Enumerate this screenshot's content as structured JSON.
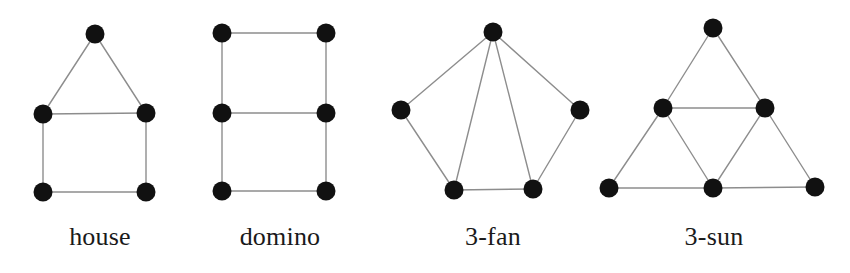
{
  "figure": {
    "type": "graph-diagram",
    "background_color": "#ffffff",
    "node_color": "#111111",
    "edge_color": "#8d8d8d",
    "label_color": "#1a1a1a",
    "node_radius": 9.5,
    "edge_width": 1.4,
    "width": 850,
    "height": 273
  },
  "graphs": [
    {
      "id": "house",
      "label": "house",
      "node_count": 5,
      "edge_count": 6,
      "nodes": [
        {
          "id": "a",
          "x": 95,
          "y": 34
        },
        {
          "id": "b",
          "x": 43,
          "y": 114
        },
        {
          "id": "c",
          "x": 146,
          "y": 113
        },
        {
          "id": "d",
          "x": 43,
          "y": 192
        },
        {
          "id": "e",
          "x": 146,
          "y": 192
        }
      ],
      "edges": [
        [
          "a",
          "b"
        ],
        [
          "a",
          "c"
        ],
        [
          "b",
          "c"
        ],
        [
          "b",
          "d"
        ],
        [
          "c",
          "e"
        ],
        [
          "d",
          "e"
        ]
      ]
    },
    {
      "id": "domino",
      "label": "domino",
      "node_count": 6,
      "edge_count": 7,
      "nodes": [
        {
          "id": "a",
          "x": 222,
          "y": 33
        },
        {
          "id": "b",
          "x": 326,
          "y": 33
        },
        {
          "id": "c",
          "x": 222,
          "y": 113
        },
        {
          "id": "d",
          "x": 326,
          "y": 113
        },
        {
          "id": "e",
          "x": 222,
          "y": 191
        },
        {
          "id": "f",
          "x": 326,
          "y": 191
        }
      ],
      "edges": [
        [
          "a",
          "b"
        ],
        [
          "a",
          "c"
        ],
        [
          "b",
          "d"
        ],
        [
          "c",
          "d"
        ],
        [
          "c",
          "e"
        ],
        [
          "d",
          "f"
        ],
        [
          "e",
          "f"
        ]
      ]
    },
    {
      "id": "3-fan",
      "label": "3-fan",
      "node_count": 5,
      "edge_count": 7,
      "nodes": [
        {
          "id": "apex",
          "x": 493,
          "y": 32
        },
        {
          "id": "l",
          "x": 401,
          "y": 110
        },
        {
          "id": "r",
          "x": 580,
          "y": 110
        },
        {
          "id": "bl",
          "x": 454,
          "y": 190
        },
        {
          "id": "br",
          "x": 533,
          "y": 189
        }
      ],
      "edges": [
        [
          "apex",
          "l"
        ],
        [
          "apex",
          "bl"
        ],
        [
          "apex",
          "br"
        ],
        [
          "apex",
          "r"
        ],
        [
          "l",
          "bl"
        ],
        [
          "bl",
          "br"
        ],
        [
          "br",
          "r"
        ]
      ]
    },
    {
      "id": "3-sun",
      "label": "3-sun",
      "node_count": 6,
      "edge_count": 9,
      "nodes": [
        {
          "id": "top",
          "x": 713,
          "y": 28
        },
        {
          "id": "ml",
          "x": 663,
          "y": 108
        },
        {
          "id": "mr",
          "x": 765,
          "y": 108
        },
        {
          "id": "bl",
          "x": 609,
          "y": 188
        },
        {
          "id": "bm",
          "x": 713,
          "y": 188
        },
        {
          "id": "br",
          "x": 815,
          "y": 187
        }
      ],
      "edges": [
        [
          "top",
          "ml"
        ],
        [
          "top",
          "mr"
        ],
        [
          "ml",
          "mr"
        ],
        [
          "ml",
          "bl"
        ],
        [
          "ml",
          "bm"
        ],
        [
          "mr",
          "bm"
        ],
        [
          "mr",
          "br"
        ],
        [
          "bl",
          "bm"
        ],
        [
          "bm",
          "br"
        ]
      ]
    }
  ],
  "labels": {
    "house": "house",
    "domino": "domino",
    "fan": "3-fan",
    "sun": "3-sun"
  }
}
